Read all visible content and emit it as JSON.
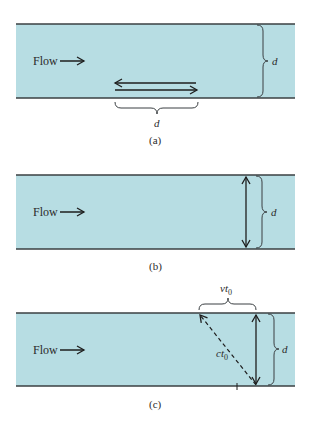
{
  "colors": {
    "water": "#b7dde3",
    "wall": "#3a3f42",
    "ink": "#1e1e1e"
  },
  "panels": [
    {
      "id": "a",
      "caption": "(a)",
      "flow_label": "Flow",
      "right_brace_label": "d",
      "bottom_brace_label": "d",
      "description": "Sound pulse travels upstream and downstream over distance d"
    },
    {
      "id": "b",
      "caption": "(b)",
      "flow_label": "Flow",
      "right_brace_label": "d",
      "description": "Pulse travels across channel width d"
    },
    {
      "id": "c",
      "caption": "(c)",
      "flow_label": "Flow",
      "right_brace_label": "d",
      "top_brace_label": "vt",
      "top_brace_subscript": "0",
      "diagonal_label": "ct",
      "diagonal_subscript": "0",
      "description": "Pulse path deflected by flow: diagonal ct0, drift vt0"
    }
  ]
}
